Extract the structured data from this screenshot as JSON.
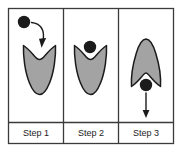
{
  "figure": {
    "panel_count": 3,
    "frame": {
      "stroke_color": "#3b3b3b",
      "background_color": "#ffffff"
    }
  },
  "colors": {
    "shape_fill": "#a3a3a3",
    "shape_stroke": "#1b1b1b",
    "ball_fill": "#1b1b1b",
    "arrow_color": "#1b1b1b",
    "frame_stroke": "#3b3b3b",
    "label_text": "#1b1b1b",
    "page_background": "#ffffff"
  },
  "panels": [
    {
      "id": "panel-1",
      "label": "Step 1",
      "shape_name": "open-valley-wide",
      "ball": {
        "visible": true,
        "position": "upper-left-outside",
        "cx": 24,
        "cy": 22,
        "r": 6.2
      },
      "arrow": {
        "visible": true,
        "name": "curved-arrow-down-into-valley",
        "type": "curved",
        "direction": "down-right-into-well"
      }
    },
    {
      "id": "panel-2",
      "label": "Step 2",
      "shape_name": "open-valley-wide",
      "ball": {
        "visible": true,
        "position": "resting-in-valley-notch",
        "cx": 90,
        "cy": 47,
        "r": 6.2
      },
      "arrow": {
        "visible": false,
        "name": "none",
        "type": "none",
        "direction": "none"
      }
    },
    {
      "id": "panel-3",
      "label": "Step 3",
      "shape_name": "closed-peak-narrow",
      "ball": {
        "visible": true,
        "position": "bottom-notch-exiting",
        "cx": 146,
        "cy": 85,
        "r": 6.2
      },
      "arrow": {
        "visible": true,
        "name": "straight-arrow-down-out-of-shape",
        "type": "straight",
        "direction": "down"
      }
    }
  ],
  "labels_row": {
    "name": "step-labels-row",
    "items": [
      "Step 1",
      "Step 2",
      "Step 3"
    ]
  }
}
